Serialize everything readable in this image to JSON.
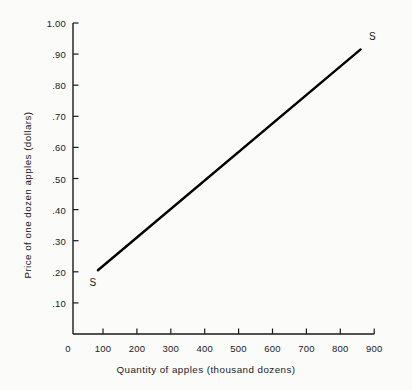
{
  "chart_data": {
    "type": "line",
    "title": "",
    "subtitle": "",
    "xlabel": "Quantity of apples (thousand dozens)",
    "ylabel": "Price of one dozen apples (dollars)",
    "xlim": [
      0,
      900
    ],
    "ylim": [
      0,
      1.0
    ],
    "grid": false,
    "legend_position": "none",
    "xticks": [
      0,
      100,
      200,
      300,
      400,
      500,
      600,
      700,
      800,
      900
    ],
    "xtick_labels": [
      "0",
      "100",
      "200",
      "300",
      "400",
      "500",
      "600",
      "700",
      "800",
      "900"
    ],
    "yticks": [
      0.1,
      0.2,
      0.3,
      0.4,
      0.5,
      0.6,
      0.7,
      0.8,
      0.9,
      1.0
    ],
    "ytick_labels": [
      ".10",
      ".20",
      ".30",
      ".40",
      ".50",
      ".60",
      ".70",
      ".80",
      ".90",
      "1.00"
    ],
    "series": [
      {
        "name": "S",
        "type": "line",
        "color": "#000000",
        "x": [
          85,
          860
        ],
        "y": [
          0.205,
          0.915
        ]
      }
    ],
    "annotations": [
      {
        "text": "S",
        "x": 60,
        "y": 0.165,
        "anchor": "curve-start-label"
      },
      {
        "text": "S",
        "x": 885,
        "y": 0.955,
        "anchor": "curve-end-label"
      }
    ],
    "colors": {
      "background": "#fbfbfa",
      "axis": "#1a1a1a",
      "curve": "#000000",
      "text": "#1a1a1a"
    }
  }
}
